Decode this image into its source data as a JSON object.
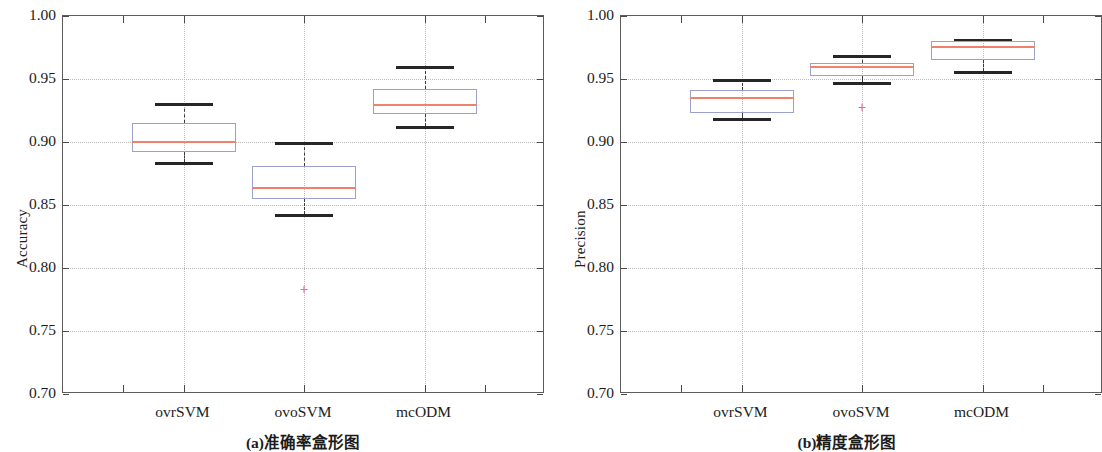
{
  "figure": {
    "width": 1088,
    "height": 452,
    "colors": {
      "box_edge": "#9aa2cb",
      "median": "#f0816d",
      "whisker_cap": "#262626",
      "outlier": "#e8705a",
      "grid": "#b9b9b9",
      "axis": "#5b5b5b",
      "text": "#1c1c1c"
    }
  },
  "chart_data": [
    {
      "type": "box",
      "panel_id": "a",
      "title": "(a)准确率盒形图",
      "xlabel": "",
      "ylabel": "Accuracy",
      "ylim": [
        0.7,
        1.0
      ],
      "ytick_labels": [
        "1.00",
        "0.95",
        "0.90",
        "0.85",
        "0.80",
        "0.75",
        "0.70"
      ],
      "ytick_values": [
        1.0,
        0.95,
        0.9,
        0.85,
        0.8,
        0.75,
        0.7
      ],
      "grid": true,
      "categories": [
        "ovrSVM",
        "ovoSVM",
        "mcODM"
      ],
      "boxes": [
        {
          "category": "ovrSVM",
          "whisker_low": 0.884,
          "q1": 0.892,
          "median": 0.901,
          "q3": 0.915,
          "whisker_high": 0.931,
          "outliers": []
        },
        {
          "category": "ovoSVM",
          "whisker_low": 0.843,
          "q1": 0.855,
          "median": 0.864,
          "q3": 0.881,
          "whisker_high": 0.9,
          "outliers": [
            0.783
          ]
        },
        {
          "category": "mcODM",
          "whisker_low": 0.913,
          "q1": 0.922,
          "median": 0.93,
          "q3": 0.942,
          "whisker_high": 0.96,
          "outliers": []
        }
      ]
    },
    {
      "type": "box",
      "panel_id": "b",
      "title": "(b)精度盒形图",
      "xlabel": "",
      "ylabel": "Precision",
      "ylim": [
        0.7,
        1.0
      ],
      "ytick_labels": [
        "1.00",
        "0.95",
        "0.90",
        "0.85",
        "0.80",
        "0.75",
        "0.70"
      ],
      "ytick_values": [
        1.0,
        0.95,
        0.9,
        0.85,
        0.8,
        0.75,
        0.7
      ],
      "grid": true,
      "categories": [
        "ovrSVM",
        "ovoSVM",
        "mcODM"
      ],
      "boxes": [
        {
          "category": "ovrSVM",
          "whisker_low": 0.919,
          "q1": 0.923,
          "median": 0.936,
          "q3": 0.941,
          "whisker_high": 0.95,
          "outliers": []
        },
        {
          "category": "ovoSVM",
          "whisker_low": 0.948,
          "q1": 0.952,
          "median": 0.96,
          "q3": 0.963,
          "whisker_high": 0.969,
          "outliers": [
            0.928
          ]
        },
        {
          "category": "mcODM",
          "whisker_low": 0.956,
          "q1": 0.965,
          "median": 0.976,
          "q3": 0.98,
          "whisker_high": 0.982,
          "outliers": []
        }
      ]
    }
  ],
  "panels": [
    {
      "name": "accuracy-boxplot",
      "ylabel": "Accuracy",
      "caption": "(a)准确率盒形图",
      "xtick_labels": [
        "ovrSVM",
        "ovoSVM",
        "mcODM"
      ],
      "ytick_labels": [
        "1.00",
        "0.95",
        "0.90",
        "0.85",
        "0.80",
        "0.75",
        "0.70"
      ]
    },
    {
      "name": "precision-boxplot",
      "ylabel": "Precision",
      "caption": "(b)精度盒形图",
      "xtick_labels": [
        "ovrSVM",
        "ovoSVM",
        "mcODM"
      ],
      "ytick_labels": [
        "1.00",
        "0.95",
        "0.90",
        "0.85",
        "0.80",
        "0.75",
        "0.70"
      ]
    }
  ],
  "outlier_glyph": "+"
}
